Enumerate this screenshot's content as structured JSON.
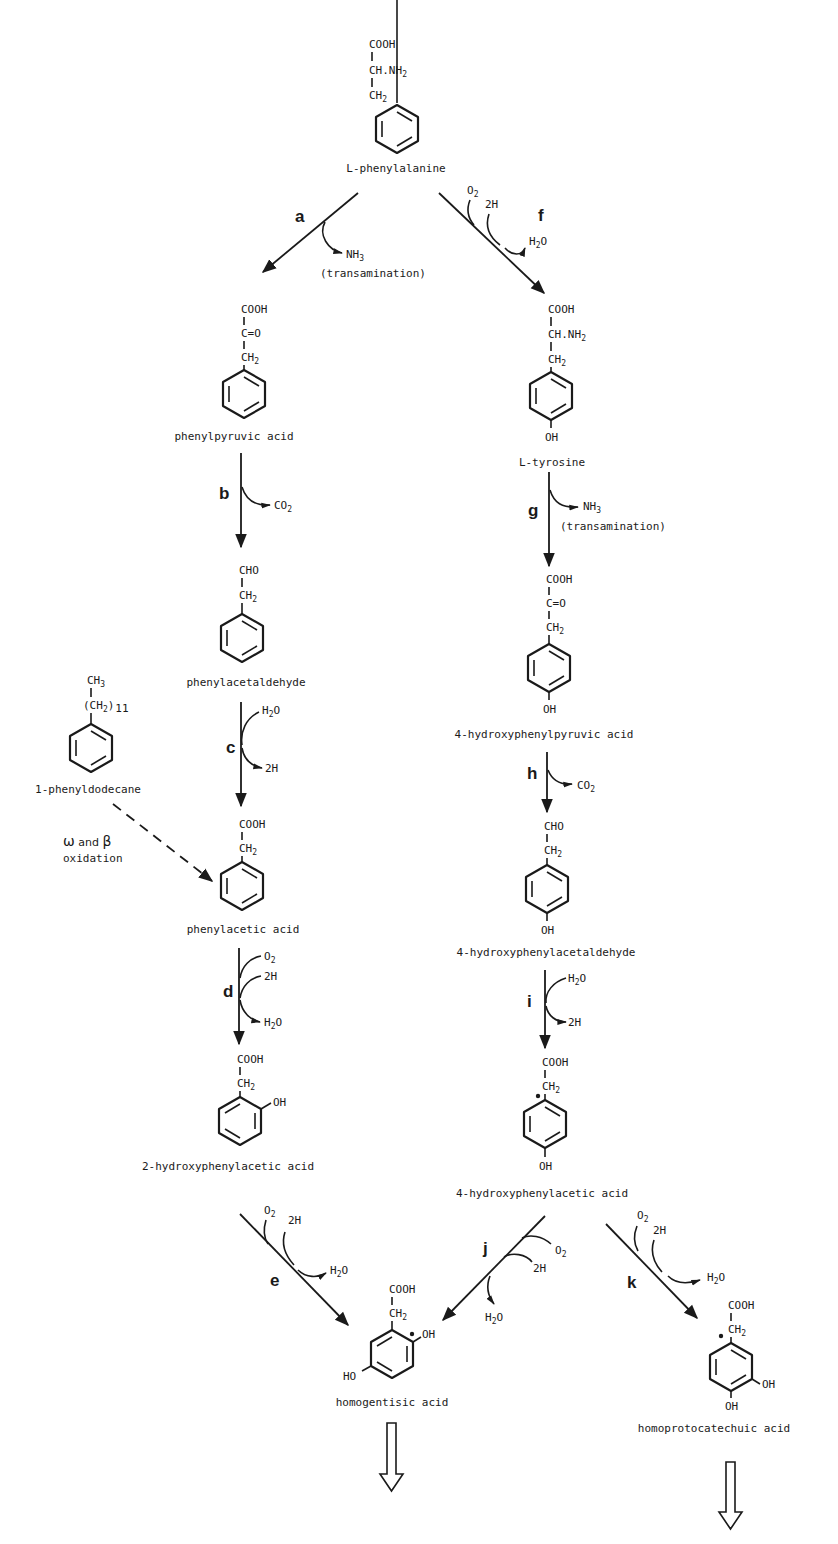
{
  "compounds": {
    "phenylalanine": {
      "name": "L-phenylalanine",
      "g1": "COOH",
      "g2": "CH.NH",
      "g2_sub": "2",
      "g3": "CH",
      "g3_sub": "2"
    },
    "phenylpyruvic": {
      "name": "phenylpyruvic acid",
      "g1": "COOH",
      "g2": "C=O",
      "g3": "CH",
      "g3_sub": "2"
    },
    "phenylacetaldehyde": {
      "name": "phenylacetaldehyde",
      "g1": "CHO",
      "g2": "CH",
      "g2_sub": "2"
    },
    "phenyldodecane": {
      "name": "1-phenyldodecane",
      "g1": "CH",
      "g1_sub": "3",
      "g2": "(CH",
      "g2_sub": "2",
      "g2_tail": ")",
      "g2_count": "11"
    },
    "phenylacetic": {
      "name": "phenylacetic acid",
      "g1": "COOH",
      "g2": "CH",
      "g2_sub": "2"
    },
    "hydroxyphenylacetic2": {
      "name": "2-hydroxyphenylacetic acid",
      "g1": "COOH",
      "g2": "CH",
      "g2_sub": "2",
      "oh": "OH"
    },
    "tyrosine": {
      "name": "L-tyrosine",
      "g1": "COOH",
      "g2": "CH.NH",
      "g2_sub": "2",
      "g3": "CH",
      "g3_sub": "2",
      "oh": "OH"
    },
    "hydroxyphenylpyruvic4": {
      "name": "4-hydroxyphenylpyruvic acid",
      "g1": "COOH",
      "g2": "C=O",
      "g3": "CH",
      "g3_sub": "2",
      "oh": "OH"
    },
    "hydroxyphenylacetaldehyde4": {
      "name": "4-hydroxyphenylacetaldehyde",
      "g1": "CHO",
      "g2": "CH",
      "g2_sub": "2",
      "oh": "OH"
    },
    "hydroxyphenylacetic4": {
      "name": "4-hydroxyphenylacetic acid",
      "g1": "COOH",
      "g2": "CH",
      "g2_sub": "2",
      "oh": "OH"
    },
    "homogentisic": {
      "name": "homogentisic acid",
      "g1": "COOH",
      "g2": "CH",
      "g2_sub": "2",
      "oh1": "OH",
      "oh2": "HO"
    },
    "homoprotocatechuic": {
      "name": "homoprotocatechuic acid",
      "g1": "COOH",
      "g2": "CH",
      "g2_sub": "2",
      "oh1": "OH",
      "oh2": "OH"
    }
  },
  "steps": {
    "a": {
      "label": "a",
      "out": "NH",
      "out_sub": "3",
      "note": "(transamination)"
    },
    "b": {
      "label": "b",
      "out": "CO",
      "out_sub": "2"
    },
    "c": {
      "label": "c",
      "in": "H",
      "in_sub": "2",
      "in_tail": "O",
      "out": "2H"
    },
    "d": {
      "label": "d",
      "in1": "O",
      "in1_sub": "2",
      "in2": "2H",
      "out": "H",
      "out_sub": "2",
      "out_tail": "O"
    },
    "e": {
      "label": "e",
      "in1": "O",
      "in1_sub": "2",
      "in2": "2H",
      "out": "H",
      "out_sub": "2",
      "out_tail": "O"
    },
    "f": {
      "label": "f",
      "in1": "O",
      "in1_sub": "2",
      "in2": "2H",
      "out": "H",
      "out_sub": "2",
      "out_tail": "O"
    },
    "g": {
      "label": "g",
      "out": "NH",
      "out_sub": "3",
      "note": "(transamination)"
    },
    "h": {
      "label": "h",
      "out": "CO",
      "out_sub": "2"
    },
    "i": {
      "label": "i",
      "in": "H",
      "in_sub": "2",
      "in_tail": "O",
      "out": "2H"
    },
    "j": {
      "label": "j",
      "in1": "O",
      "in1_sub": "2",
      "in2": "2H",
      "out": "H",
      "out_sub": "2",
      "out_tail": "O"
    },
    "k": {
      "label": "k",
      "in1": "O",
      "in1_sub": "2",
      "in2": "2H",
      "out": "H",
      "out_sub": "2",
      "out_tail": "O"
    }
  },
  "side_path": {
    "omega": "ω",
    "and": " and ",
    "beta": "β",
    "line2": "oxidation"
  },
  "continuation_arrows": [
    "homogentisic-continues",
    "homoprotocatechuic-continues"
  ]
}
